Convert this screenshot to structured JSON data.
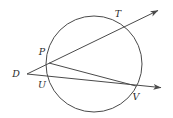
{
  "figure": {
    "background_color": "#ffffff",
    "stroke_color": "#4a4a4a",
    "label_color": "#2b2b2b",
    "circle": {
      "name": "circle",
      "cx": 94,
      "cy": 64,
      "r": 48
    },
    "external_point": {
      "name": "D",
      "x": 27,
      "y": 74
    },
    "rays": [
      {
        "name": "ray-D-P-T",
        "from": [
          27,
          74
        ],
        "to": [
          161,
          9
        ],
        "through": [
          "P",
          "T"
        ],
        "arrow": true
      },
      {
        "name": "ray-D-U-V",
        "from": [
          27,
          74
        ],
        "to": [
          165,
          88
        ],
        "through": [
          "U",
          "V"
        ],
        "arrow": true
      }
    ],
    "chord": {
      "name": "chord-P-V",
      "from": [
        49,
        63
      ],
      "to": [
        136,
        86
      ]
    },
    "points": [
      {
        "id": "D",
        "label": "D",
        "px": 27,
        "py": 74,
        "lx": 16,
        "ly": 77
      },
      {
        "id": "P",
        "label": "P",
        "px": 49,
        "py": 63,
        "lx": 42,
        "ly": 55
      },
      {
        "id": "T",
        "label": "T",
        "px": 122,
        "py": 26,
        "lx": 118,
        "ly": 17
      },
      {
        "id": "U",
        "label": "U",
        "px": 48,
        "py": 76,
        "lx": 42,
        "ly": 88
      },
      {
        "id": "V",
        "label": "V",
        "px": 136,
        "py": 86,
        "lx": 136,
        "ly": 100
      }
    ]
  }
}
